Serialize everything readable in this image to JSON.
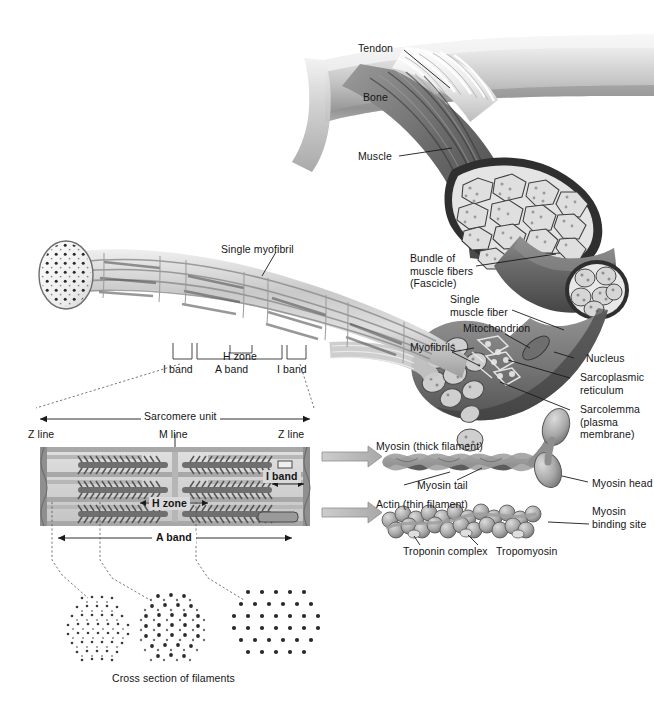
{
  "figure": {
    "caption": "Cross section of filaments"
  },
  "colors": {
    "bone": "#cfcfcf",
    "bone_shadow": "#8e8e8e",
    "tendon": "#e9e9e9",
    "muscle_dark": "#5d5d5d",
    "muscle_mid": "#8a8a8a",
    "myofibril_light": "#e3e3e3",
    "myofibril_mid": "#b9b9b9",
    "sarcomere_bg": "#d6d6d6",
    "zline": "#8c8c8c",
    "filament_dark": "#6b6b6b",
    "arrow_gray": "#b3b3b3",
    "text": "#151515"
  },
  "gross_anatomy": {
    "labels": [
      {
        "id": "tendon",
        "text": "Tendon"
      },
      {
        "id": "bone",
        "text": "Bone"
      },
      {
        "id": "muscle",
        "text": "Muscle"
      }
    ]
  },
  "fiber_level": {
    "labels": [
      {
        "id": "bundle",
        "text": "Bundle of\nmuscle fibers\n(Fascicle)"
      },
      {
        "id": "single_fiber",
        "text": "Single\nmuscle fiber"
      },
      {
        "id": "mitochondrion",
        "text": "Mitochondrion"
      },
      {
        "id": "myofibrils",
        "text": "Myofibrils"
      },
      {
        "id": "nucleus",
        "text": "Nucleus"
      },
      {
        "id": "sarcoplasmic_reticulum",
        "text": "Sarcoplasmic\nreticulum"
      },
      {
        "id": "sarcolemma",
        "text": "Sarcolemma\n(plasma\nmembrane)"
      }
    ]
  },
  "myofibril_level": {
    "label": "Single myofibril",
    "bands": [
      {
        "id": "i_band_left",
        "text": "I band"
      },
      {
        "id": "h_zone",
        "text": "H zone"
      },
      {
        "id": "a_band",
        "text": "A band"
      },
      {
        "id": "i_band_right",
        "text": "I band"
      }
    ]
  },
  "sarcomere": {
    "title": "Sarcomere unit",
    "z_line_left": "Z line",
    "m_line": "M line",
    "z_line_right": "Z line",
    "h_zone": "H zone",
    "i_band": "I band",
    "a_band": "A band"
  },
  "filaments": {
    "myosin_title": "Myosin (thick filament)",
    "myosin_tail": "Myosin tail",
    "myosin_head": "Myosin head",
    "actin_title": "Actin (thin filament)",
    "myosin_binding_site": "Myosin\nbinding site",
    "troponin_complex": "Troponin complex",
    "tropomyosin": "Tropomyosin"
  },
  "cross_sections": {
    "caption": "Cross section of filaments",
    "items": [
      {
        "id": "i-band-cross-section",
        "description": "thin filaments only"
      },
      {
        "id": "overlap-cross-section",
        "description": "thick and thin filaments"
      },
      {
        "id": "h-zone-cross-section",
        "description": "thick filaments only"
      }
    ]
  }
}
